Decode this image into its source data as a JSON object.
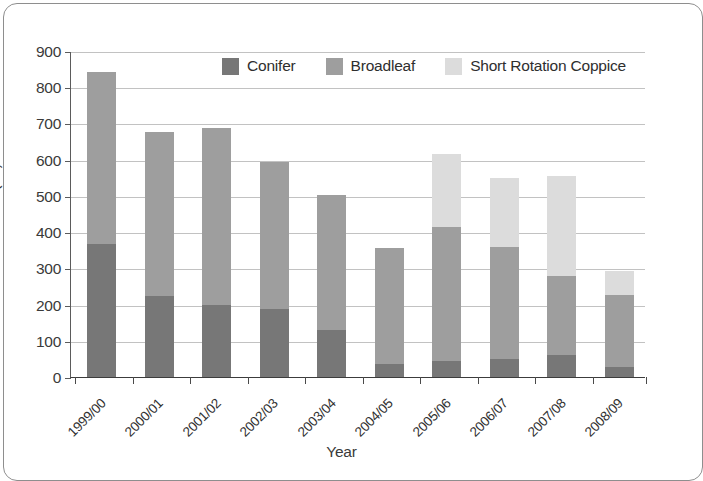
{
  "chart_data": {
    "type": "bar",
    "stacked": true,
    "title": "",
    "xlabel": "Year",
    "ylabel": "Area (ha)",
    "ylim": [
      0,
      900
    ],
    "ytick_step": 100,
    "yticks": [
      0,
      100,
      200,
      300,
      400,
      500,
      600,
      700,
      800,
      900
    ],
    "grid": true,
    "legend_position": "top-center-inside",
    "categories": [
      "1999/00",
      "2000/01",
      "2001/02",
      "2002/03",
      "2003/04",
      "2004/05",
      "2005/06",
      "2006/07",
      "2007/08",
      "2008/09"
    ],
    "series": [
      {
        "name": "Conifer",
        "color": "#777777",
        "values": [
          367,
          224,
          198,
          188,
          131,
          37,
          45,
          50,
          60,
          27
        ]
      },
      {
        "name": "Broadleaf",
        "color": "#9e9e9e",
        "values": [
          475,
          452,
          490,
          406,
          372,
          320,
          368,
          308,
          218,
          200
        ]
      },
      {
        "name": "Short Rotation Coppice",
        "color": "#dcdcdc",
        "values": [
          0,
          0,
          0,
          0,
          0,
          0,
          202,
          192,
          277,
          65
        ]
      }
    ],
    "totals": [
      842,
      676,
      688,
      594,
      503,
      357,
      615,
      550,
      555,
      292
    ]
  },
  "axes": {
    "y_title": "Area (ha)",
    "x_title": "Year",
    "y_tick_labels": [
      "900",
      "800",
      "700",
      "600",
      "500",
      "400",
      "300",
      "200",
      "100",
      "0"
    ]
  },
  "legend": {
    "items": [
      {
        "label": "Conifer",
        "color": "#777777"
      },
      {
        "label": "Broadleaf",
        "color": "#9e9e9e"
      },
      {
        "label": "Short Rotation Coppice",
        "color": "#dcdcdc"
      }
    ]
  },
  "colors": {
    "conifer": "#777777",
    "broadleaf": "#9e9e9e",
    "short_rotation_coppice": "#dcdcdc",
    "gridline": "#c2c2c2",
    "axis": "#4a4a4a",
    "text": "#303030",
    "frame": "#8e8e8e",
    "background": "#ffffff"
  }
}
